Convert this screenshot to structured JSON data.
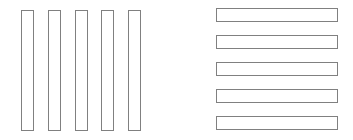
{
  "figure": {
    "background_color": "#ffffff",
    "width": 353,
    "height": 140
  },
  "chart_data": {
    "type": "bar",
    "title": "",
    "subtitle": "",
    "xlabel": "",
    "ylabel": "",
    "grid": false,
    "legend": null,
    "annotations": [],
    "style": {
      "fill_color": "#ffffff",
      "stroke_color": "#808080",
      "stroke_width": 1,
      "background_color": "#ffffff"
    },
    "groups": [
      {
        "name": "left-group-vertical-bars",
        "orientation": "vertical",
        "count": 5,
        "categories": [
          "v1",
          "v2",
          "v3",
          "v4",
          "v5"
        ],
        "values": [
          121,
          121,
          121,
          121,
          121
        ],
        "bars": [
          {
            "label": "v1",
            "x": 21,
            "y": 10,
            "width": 13,
            "height": 121
          },
          {
            "label": "v2",
            "x": 48,
            "y": 10,
            "width": 13,
            "height": 121
          },
          {
            "label": "v3",
            "x": 75,
            "y": 10,
            "width": 13,
            "height": 121
          },
          {
            "label": "v4",
            "x": 101,
            "y": 10,
            "width": 13,
            "height": 121
          },
          {
            "label": "v5",
            "x": 128,
            "y": 10,
            "width": 13,
            "height": 121
          }
        ]
      },
      {
        "name": "right-group-horizontal-bars",
        "orientation": "horizontal",
        "count": 5,
        "categories": [
          "h1",
          "h2",
          "h3",
          "h4",
          "h5"
        ],
        "values": [
          122,
          122,
          122,
          122,
          122
        ],
        "bars": [
          {
            "label": "h1",
            "x": 216,
            "y": 8,
            "width": 122,
            "height": 14
          },
          {
            "label": "h2",
            "x": 216,
            "y": 35,
            "width": 122,
            "height": 14
          },
          {
            "label": "h3",
            "x": 216,
            "y": 62,
            "width": 122,
            "height": 14
          },
          {
            "label": "h4",
            "x": 216,
            "y": 89,
            "width": 122,
            "height": 14
          },
          {
            "label": "h5",
            "x": 216,
            "y": 116,
            "width": 122,
            "height": 14
          }
        ]
      }
    ]
  }
}
